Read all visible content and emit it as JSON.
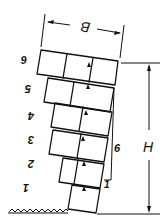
{
  "figure": {
    "dimensions": {
      "width_label": "B",
      "height_label": "H",
      "lean_label": "6",
      "lean_base_label": "1"
    },
    "block_labels": [
      "1",
      "2",
      "3",
      "4",
      "5",
      "6"
    ],
    "colors": {
      "ink": "#111111",
      "background": "#ffffff"
    }
  }
}
